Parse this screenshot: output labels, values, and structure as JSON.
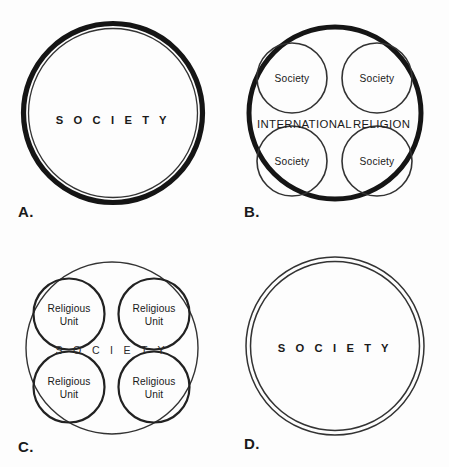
{
  "figure": {
    "background_color": "#fdfdfd",
    "ink_color": "#151515",
    "width": 449,
    "height": 467
  },
  "panels": [
    {
      "id": "A",
      "label": "A.",
      "description": "Single thick circle with thin inner outline enclosing society",
      "center_label": "S O C I E T Y",
      "center_label_plain": "SOCIETY",
      "outer_ring_style": "thick-double",
      "inner_circles": []
    },
    {
      "id": "B",
      "label": "B.",
      "description": "Thick circle labeled international religion containing four separate society circles",
      "center_label": "INTERNATIONAL  RELIGION",
      "center_label_word_1": "INTERNATIONAL",
      "center_label_word_2": "RELIGION",
      "outer_ring_style": "thick-single",
      "inner_circles": [
        {
          "label": "Society"
        },
        {
          "label": "Society"
        },
        {
          "label": "Society"
        },
        {
          "label": "Society"
        }
      ]
    },
    {
      "id": "C",
      "label": "C.",
      "description": "Thin circle labeled society containing four religious unit circles",
      "center_label": "S O C I E T Y",
      "center_label_plain": "SOCIETY",
      "outer_ring_style": "thin-single",
      "inner_circles": [
        {
          "line1": "Religious",
          "line2": "Unit"
        },
        {
          "line1": "Religious",
          "line2": "Unit"
        },
        {
          "line1": "Religious",
          "line2": "Unit"
        },
        {
          "line1": "Religious",
          "line2": "Unit"
        }
      ]
    },
    {
      "id": "D",
      "label": "D.",
      "description": "Double thin concentric circle enclosing society",
      "center_label": "S O C I E T Y",
      "center_label_plain": "SOCIETY",
      "outer_ring_style": "thin-double",
      "inner_circles": []
    }
  ]
}
